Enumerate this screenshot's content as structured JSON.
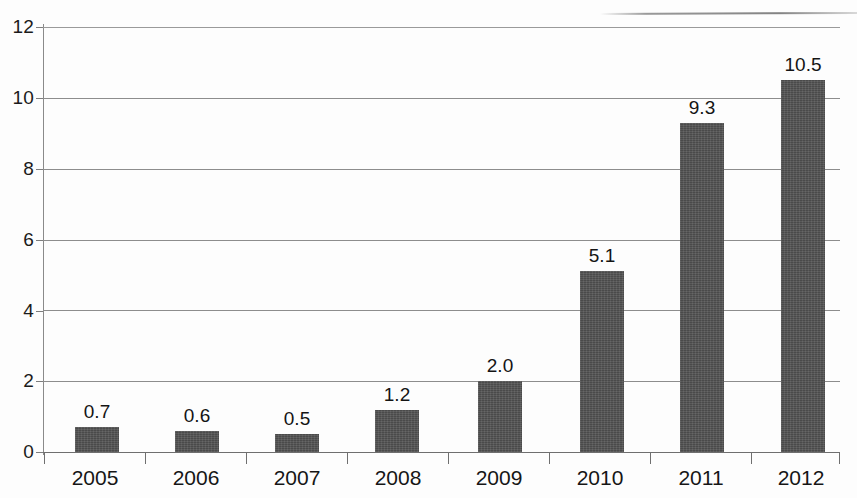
{
  "chart_data": {
    "type": "bar",
    "title": "",
    "subtitle": "",
    "xlabel": "",
    "ylabel": "",
    "categories": [
      "2005",
      "2006",
      "2007",
      "2008",
      "2009",
      "2010",
      "2011",
      "2012"
    ],
    "values": [
      0.7,
      0.6,
      0.5,
      1.2,
      2.0,
      5.1,
      9.3,
      10.5
    ],
    "data_labels": [
      "0.7",
      "0.6",
      "0.5",
      "1.2",
      "2.0",
      "5.1",
      "9.3",
      "10.5"
    ],
    "ylim": [
      0,
      12
    ],
    "yticks": [
      0,
      2,
      4,
      6,
      8,
      10,
      12
    ],
    "ytick_labels": [
      "0",
      "2",
      "4",
      "6",
      "8",
      "10",
      "12"
    ],
    "grid": true,
    "grid_axis": "y",
    "legend": false,
    "legend_position": "none",
    "series": [
      {
        "name": "",
        "values": [
          0.7,
          0.6,
          0.5,
          1.2,
          2.0,
          5.1,
          9.3,
          10.5
        ]
      }
    ],
    "colors": {
      "bar_fill": "#4a4a4a",
      "gridline": "#8d8d8d",
      "axis": "#6f6f6f",
      "text": "#161616",
      "background": "#fdfdfd"
    }
  }
}
